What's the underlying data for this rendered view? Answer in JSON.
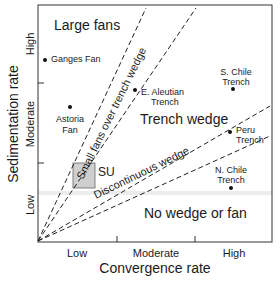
{
  "diagram": {
    "x_axis": {
      "label": "Convergence rate",
      "ticks": [
        "Low",
        "Moderate",
        "High"
      ]
    },
    "y_axis": {
      "label": "Sedimentation rate",
      "ticks": [
        "Low",
        "Moderate",
        "High"
      ]
    },
    "regions": {
      "large_fans": "Large fans",
      "small_fans": "Small fans over trench wedge",
      "trench_wedge": "Trench wedge",
      "discontinuous_wedge": "Discontinuous wedge",
      "no_wedge": "No wedge or fan"
    },
    "points": [
      {
        "name": "Ganges Fan",
        "line1": "Ganges Fan",
        "line2": ""
      },
      {
        "name": "Astoria Fan",
        "line1": "Astoria",
        "line2": "Fan"
      },
      {
        "name": "E. Aleutian Trench",
        "line1": "E. Aleutian",
        "line2": "Trench"
      },
      {
        "name": "S. Chile Trench",
        "line1": "S. Chile",
        "line2": "Trench"
      },
      {
        "name": "Peru Trench",
        "line1": "Peru",
        "line2": "Trench"
      },
      {
        "name": "N. Chile Trench",
        "line1": "N. Chile",
        "line2": "Trench"
      }
    ],
    "box_label": "SU",
    "colors": {
      "line": "#1a1a1a",
      "box_fill": "#c8c8c8",
      "band": "#e6e6e6"
    }
  }
}
